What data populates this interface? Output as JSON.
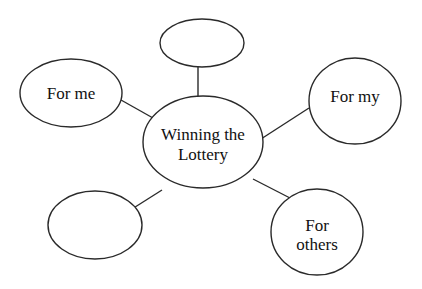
{
  "diagram": {
    "type": "mind-map",
    "center": {
      "id": "center",
      "lines": [
        "Winning the",
        "Lottery"
      ]
    },
    "nodes": [
      {
        "id": "top",
        "lines": []
      },
      {
        "id": "for-me",
        "lines": [
          "For me"
        ]
      },
      {
        "id": "for-my",
        "lines": [
          "For my"
        ]
      },
      {
        "id": "bottom-left",
        "lines": []
      },
      {
        "id": "for-others",
        "lines": [
          "For",
          "others"
        ]
      }
    ],
    "edges": [
      [
        "center",
        "top"
      ],
      [
        "center",
        "for-me"
      ],
      [
        "center",
        "for-my"
      ],
      [
        "center",
        "bottom-left"
      ],
      [
        "center",
        "for-others"
      ]
    ]
  },
  "colors": {
    "stroke": "#2a2a2a",
    "text": "#111111",
    "background": "#ffffff"
  }
}
